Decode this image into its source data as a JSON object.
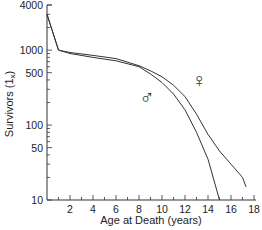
{
  "chart_data": {
    "type": "line",
    "title": "",
    "xlabel": "Age at Death (years)",
    "ylabel": "Survivors (1x)",
    "yscale": "log",
    "xlim": [
      0,
      18
    ],
    "ylim": [
      10,
      4000
    ],
    "x_ticks": [
      "2",
      "4",
      "6",
      "8",
      "10",
      "12",
      "14",
      "16",
      "18"
    ],
    "y_ticks": [
      "4000",
      "1000",
      "500",
      "100",
      "50",
      "10"
    ],
    "grid": false,
    "legend": "symbols placed on chart (♂ male, ♀ female)",
    "series": [
      {
        "name": "male",
        "symbol": "♂",
        "x": [
          0,
          1,
          2,
          4,
          6,
          8,
          9,
          10,
          11,
          12,
          13,
          14,
          15
        ],
        "y": [
          3000,
          1000,
          900,
          800,
          720,
          600,
          480,
          370,
          260,
          160,
          80,
          35,
          10
        ]
      },
      {
        "name": "female",
        "symbol": "♀",
        "x": [
          0,
          1,
          2,
          4,
          6,
          8,
          9,
          10,
          11,
          12,
          13,
          14,
          15,
          16,
          17,
          17.3
        ],
        "y": [
          3000,
          1000,
          930,
          850,
          770,
          620,
          530,
          440,
          340,
          240,
          140,
          75,
          45,
          30,
          20,
          15
        ]
      }
    ]
  },
  "axes": {
    "xlabel": "Age at Death (years)",
    "ylabel": "Survivors (1x)",
    "ylabel_main": "Survivors (1",
    "ylabel_sub": "x",
    "ylabel_close": ")"
  },
  "symbols": {
    "male": "♂",
    "female": "♀"
  }
}
